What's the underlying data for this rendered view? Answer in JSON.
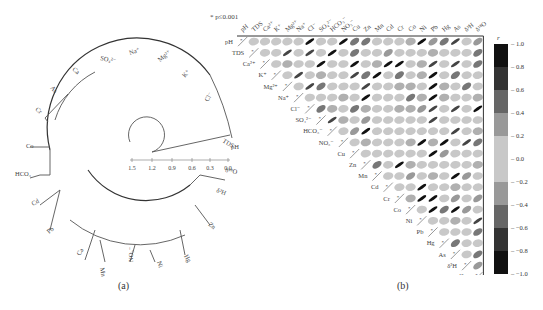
{
  "note": "* p≤0.001",
  "panels": {
    "a": {
      "label": "(a)"
    },
    "b": {
      "label": "(b)"
    }
  },
  "chart_data": [
    {
      "type": "dendrogram",
      "title": "(a)",
      "layout": "circular",
      "scale": {
        "ticks": [
          "1.5",
          "1.2",
          "0.9",
          "0.6",
          "0.3",
          "0.0"
        ],
        "range": [
          1.5,
          0.0
        ]
      },
      "leaves": [
        "pH",
        "TDS",
        "Cl⁻",
        "K⁺",
        "Mg²⁺",
        "Na⁺",
        "SO₄²⁻",
        "Ca",
        "As",
        "Cr",
        "Co",
        "HCO₃",
        "Cd",
        "Pb",
        "Cu",
        "Mn",
        "NO₃⁻",
        "Ni",
        "Hg",
        "Zn",
        "δ²H",
        "δ¹⁸O"
      ]
    },
    {
      "type": "heatmap",
      "title": "(b)",
      "style": "correlation ellipse matrix (upper triangle), significance marks in lower diagonal",
      "variables": [
        "pH",
        "TDS",
        "Ca²⁺",
        "K⁺",
        "Mg²⁺",
        "Na⁺",
        "Cl⁻",
        "SO₄²⁻",
        "HCO₃⁻",
        "NO₃⁻",
        "Cu",
        "Zn",
        "Mn",
        "Cd",
        "Cr",
        "Co",
        "Ni",
        "Pb",
        "Hg",
        "As",
        "δ²H",
        "δ¹⁸O"
      ],
      "colorbar": {
        "label": "r",
        "ticks": [
          "1.0",
          "0.8",
          "0.6",
          "0.4",
          "0.2",
          "0.0",
          "−0.2",
          "−0.4",
          "−0.6",
          "−0.8",
          "−1.0"
        ],
        "range": [
          -1.0,
          1.0
        ]
      },
      "significance_note": "* p≤0.001"
    }
  ]
}
